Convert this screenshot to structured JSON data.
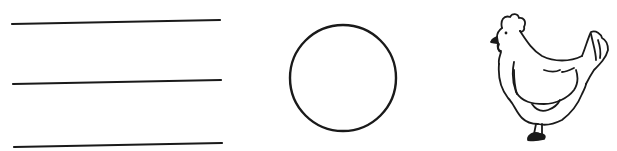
{
  "worksheet": {
    "answer_line_count": 3,
    "shapes": [
      {
        "kind": "answer-lines",
        "label": "writing lines"
      },
      {
        "kind": "circle",
        "label": "circle outline"
      },
      {
        "kind": "hen",
        "label": "hen drawing"
      }
    ],
    "colors": {
      "ink": "#1a1a1a",
      "paper": "#ffffff"
    }
  }
}
